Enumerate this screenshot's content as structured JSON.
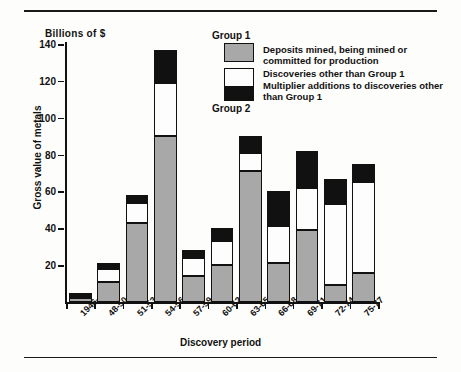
{
  "chart_data": {
    "type": "bar",
    "subtype": "stacked",
    "title": "",
    "unit_label": "Billions of $",
    "xlabel": "Discovery period",
    "ylabel": "Gross value of metals",
    "categories": [
      "1946-47",
      "48-50",
      "51-53",
      "54-56",
      "57-59",
      "60-62",
      "63-65",
      "66-68",
      "69-71",
      "72-74",
      "75-77"
    ],
    "ylim": [
      0,
      140
    ],
    "yticks": [
      20,
      40,
      60,
      80,
      100,
      120,
      140
    ],
    "grid": false,
    "legend_position": "top-right",
    "series": [
      {
        "name": "Deposits mined, being mined or committed for production",
        "color": "#a8a8a8",
        "values": [
          2,
          11,
          43,
          90,
          14,
          20,
          71,
          21,
          39,
          9,
          16
        ]
      },
      {
        "name": "Discoveries other than Group 1",
        "color": "#fdfdfd",
        "values": [
          1,
          7,
          11,
          29,
          10,
          13,
          10,
          20,
          23,
          44,
          49
        ]
      },
      {
        "name": "Multiplier additions to discoveries other than Group 1",
        "color": "#111111",
        "values": [
          2,
          3,
          4,
          18,
          4,
          7,
          9,
          19,
          20,
          14,
          10
        ]
      }
    ],
    "totals": [
      5,
      21,
      58,
      137,
      28,
      40,
      90,
      60,
      82,
      67,
      75
    ]
  },
  "legend": {
    "group1_title": "Group 1",
    "group2_title": "Group 2",
    "entries": [
      {
        "swatch": "gray",
        "label": "Deposits mined, being mined or committed for production"
      },
      {
        "swatch": "white",
        "label": "Discoveries other than Group 1"
      },
      {
        "swatch": "black",
        "label": "Multiplier additions to discoveries other than Group 1"
      }
    ]
  }
}
